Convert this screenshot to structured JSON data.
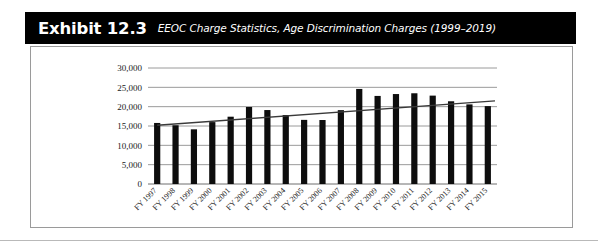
{
  "exhibit": {
    "label": "Exhibit 12.3",
    "subtitle": "EEOC Charge Statistics, Age Discrimination Charges (1999–2019)"
  },
  "colors": {
    "header_bg": "#000000",
    "header_text": "#ffffff",
    "bar": "#0d0d0d",
    "gridline": "#8f8f8f",
    "trendline": "#3a3a3a",
    "panel_border": "#9a9a9a"
  },
  "chart_data": {
    "type": "bar",
    "title": "EEOC Charge Statistics, Age Discrimination Charges (1999–2019)",
    "xlabel": "",
    "ylabel": "",
    "ylim": [
      0,
      30000
    ],
    "ytick_labels": [
      "30,000",
      "25,000",
      "20,000",
      "15,000",
      "10,000",
      "5,000",
      "0"
    ],
    "ytick_values": [
      30000,
      25000,
      20000,
      15000,
      10000,
      5000,
      0
    ],
    "grid": true,
    "legend": "none",
    "categories": [
      "FY 1997",
      "FY 1998",
      "FY 1999",
      "FY 2000",
      "FY 2001",
      "FY 2002",
      "FY 2003",
      "FY 2004",
      "FY 2005",
      "FY 2006",
      "FY 2007",
      "FY 2008",
      "FY 2009",
      "FY 2010",
      "FY 2011",
      "FY 2012",
      "FY 2013",
      "FY 2014",
      "FY 2015"
    ],
    "values": [
      15785,
      15191,
      14141,
      16008,
      17405,
      19921,
      19124,
      17837,
      16585,
      16548,
      19103,
      24582,
      22778,
      23264,
      23465,
      22857,
      21396,
      20588,
      20144
    ],
    "series": [
      {
        "name": "Age discrimination charges filed",
        "type": "bar",
        "values": [
          15785,
          15191,
          14141,
          16008,
          17405,
          19921,
          19124,
          17837,
          16585,
          16548,
          19103,
          24582,
          22778,
          23264,
          23465,
          22857,
          21396,
          20588,
          20144
        ]
      },
      {
        "name": "Linear trend",
        "type": "line",
        "start_value": 15200,
        "end_value": 21500
      }
    ]
  }
}
